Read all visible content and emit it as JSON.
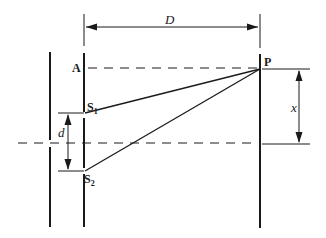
{
  "diagram": {
    "labels": {
      "A": "A",
      "S1_main": "S",
      "S1_sub": "1",
      "S2_main": "S",
      "S2_sub": "2",
      "P": "P",
      "D": "D",
      "d": "d",
      "x": "x"
    },
    "colors": {
      "line": "#1a1a1a",
      "background": "#ffffff"
    }
  }
}
